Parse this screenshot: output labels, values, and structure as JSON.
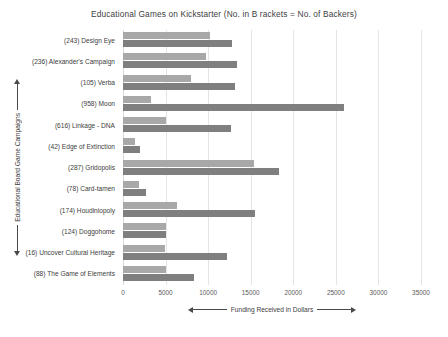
{
  "chart_data": {
    "type": "bar",
    "orientation": "horizontal",
    "title": "Educational  Games on Kickstarter (No. in B rackets = No. of Backers)",
    "xlabel": "Funding Received in Dollars",
    "ylabel": "Educational Board Game Campaigns",
    "xlim": [
      0,
      35000
    ],
    "xticks": [
      "0",
      "5000",
      "10000",
      "15000",
      "20000",
      "25000",
      "30000",
      "35000"
    ],
    "xtick_values": [
      0,
      5000,
      10000,
      15000,
      20000,
      25000,
      30000,
      35000
    ],
    "grid": true,
    "legend": "none",
    "categories": [
      "(243) Design Eye",
      "(236) Alexander's Campaign",
      "(105) Verba",
      "(958) Moon",
      "(616) Linkage - DNA",
      "(42) Edge of Extinction",
      "(287) Gridopolis",
      "(78) Card-tamen",
      "(174) Houdiniopoly",
      "(124) Doggohome",
      "(16) Uncover Cultural Heritage",
      "(88) The Game of Elements"
    ],
    "series": [
      {
        "name": "series-1",
        "color": "#a8a8a8",
        "values": [
          10200,
          9700,
          8000,
          3300,
          5000,
          1400,
          15400,
          1900,
          6400,
          5000,
          4900,
          5000
        ]
      },
      {
        "name": "series-2",
        "color": "#7f7f7f",
        "values": [
          12800,
          13400,
          13100,
          25900,
          12700,
          2000,
          18300,
          2700,
          15500,
          5000,
          12200,
          8300
        ]
      }
    ]
  }
}
